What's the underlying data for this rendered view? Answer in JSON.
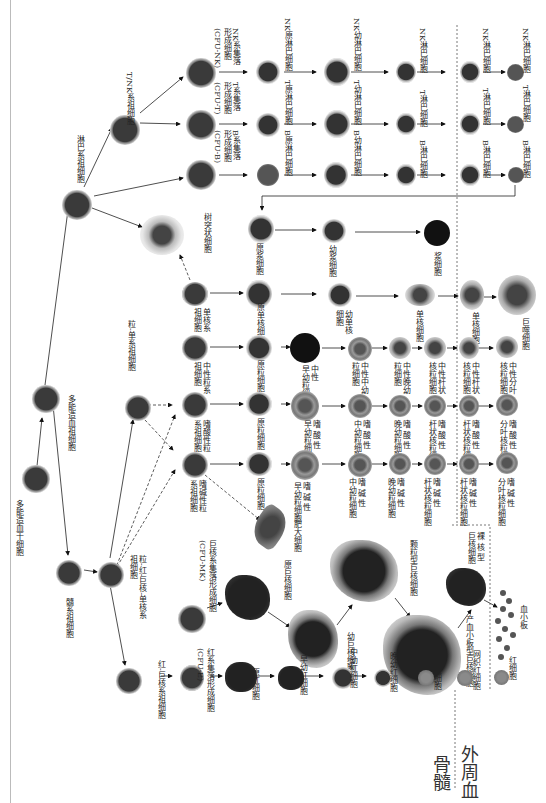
{
  "regions": {
    "bone_marrow": "骨髓",
    "peripheral_blood": "外周血"
  },
  "stem": {
    "hsc": "多能造血干细胞",
    "mpp": "多能造血祖细胞",
    "lymphoid_progenitor": "淋巴系祖细胞",
    "myeloid_progenitor": "髓系祖细胞",
    "gemm": "粒-红-巨核-单核系\n祖细胞",
    "tnk": "T/NK系祖细胞",
    "em": "红-巨核系祖细胞",
    "gm": "粒-单系祖细胞"
  },
  "lymphoid": {
    "b_cfu": "B系集落\n形成细胞\n(CFU-B)",
    "t_cfu": "T系集落\n形成细胞\n(CFU-T)",
    "nk_cfu": "NK系集落\n形成细胞\n(CFU-NK)",
    "b_row": [
      "B原淋巴细胞",
      "B幼淋巴细胞",
      "B淋巴细胞",
      "B淋巴细胞",
      "B淋巴细胞"
    ],
    "t_row": [
      "T原淋巴细胞",
      "T幼淋巴细胞",
      "T淋巴细胞",
      "T淋巴细胞",
      "T淋巴细胞"
    ],
    "nk_row": [
      "NK原淋巴细胞",
      "NK幼淋巴细胞",
      "NK淋巴细胞",
      "NK淋巴细胞",
      "NK淋巴细胞"
    ],
    "plasma_row": [
      "原浆细胞",
      "幼浆细胞",
      "浆细胞"
    ]
  },
  "dendritic": "树突状细胞",
  "monocyte": {
    "progenitor": "单核系\n祖细胞",
    "row": [
      "原单核细胞",
      "幼单核\n细胞",
      "单核细胞",
      "单核细胞",
      "巨噬细胞"
    ]
  },
  "neutrophil": {
    "progenitor": "中性粒系\n祖细胞",
    "row": [
      "原粒细胞",
      "中性\n早幼粒细胞",
      "中性中幼\n粒细胞",
      "中性晚幼\n粒细胞",
      "中性杆状\n核粒细胞",
      "中性杆状\n核粒细胞",
      "中性分叶\n核粒细胞"
    ]
  },
  "eosinophil": {
    "progenitor": "嗜酸性粒\n系祖细胞",
    "row": [
      "原粒细胞",
      "嗜 酸 性\n早幼粒细胞",
      "嗜 酸 性\n中幼粒细胞",
      "嗜 酸 性\n晚幼粒细胞",
      "嗜 酸 性\n杆状核粒细胞",
      "嗜 酸 性\n杆状核粒细胞",
      "嗜 酸 性\n分叶核粒细胞"
    ]
  },
  "basophil": {
    "progenitor": "嗜碱性粒\n系祖细胞",
    "row": [
      "原粒细胞",
      "嗜 碱 性\n早幼粒细胞",
      "嗜 碱 性\n中幼粒细胞",
      "嗜 碱 性\n晚幼粒细胞",
      "嗜 碱 性\n杆状核粒细胞",
      "嗜 碱 性\n杆状核粒细胞",
      "嗜 碱 性\n分叶核粒细胞"
    ],
    "mast": "肥大细胞"
  },
  "megakaryocyte": {
    "cfu": "巨核系集落形成细胞\n(CFU-MK)",
    "row": [
      "原巨核细胞",
      "幼巨核细胞",
      "颗粒型巨核细胞",
      "产血小板型巨核细胞",
      "裸 核 型\n巨核细胞"
    ],
    "platelet": "血小板"
  },
  "erythroid": {
    "cfu": "红系集落形成细胞\n(CFU-E)",
    "row": [
      "原红细胞",
      "早幼红细胞",
      "中幼红细胞",
      "晚幼红细胞",
      "网织红细胞",
      "网织红细胞",
      "红细胞"
    ]
  }
}
